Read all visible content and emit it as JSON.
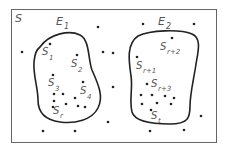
{
  "diagram": {
    "type": "venn-partition",
    "sample_space_label": "S",
    "events": [
      {
        "label": "E",
        "subscript": "1",
        "points": [
          {
            "label": "S",
            "subscript": "1"
          },
          {
            "label": "S",
            "subscript": "2"
          },
          {
            "label": "S",
            "subscript": "3"
          },
          {
            "label": "S",
            "subscript": "4"
          },
          {
            "label": "S",
            "subscript": "r"
          }
        ]
      },
      {
        "label": "E",
        "subscript": "2",
        "points": [
          {
            "label": "S",
            "subscript": "r+2"
          },
          {
            "label": "S",
            "subscript": "r+1"
          },
          {
            "label": "S",
            "subscript": "r+3"
          },
          {
            "label": "S",
            "subscript": "t"
          }
        ]
      }
    ],
    "colors": {
      "stroke": "#222222",
      "text": "#555555",
      "frame": "#666666",
      "background": "#ffffff"
    }
  }
}
